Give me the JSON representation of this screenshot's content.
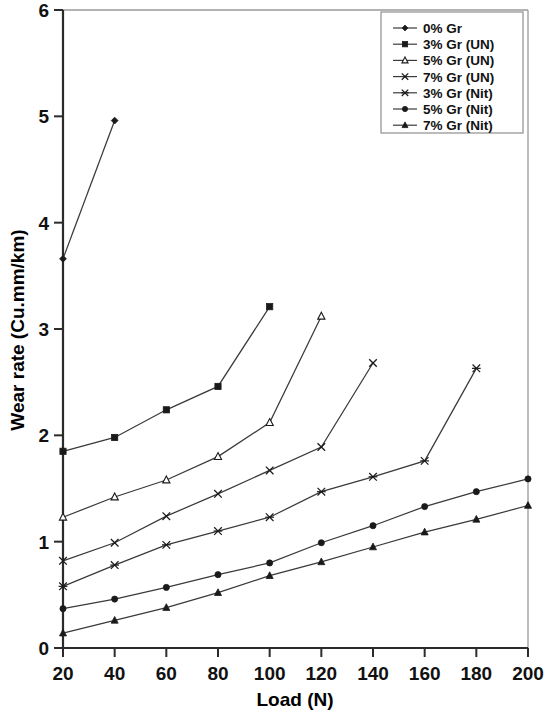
{
  "chart_data": {
    "type": "line",
    "title": "",
    "xlabel": "Load (N)",
    "ylabel": "Wear rate (Cu.mm/km)",
    "xlim": [
      20,
      200
    ],
    "ylim": [
      0,
      6
    ],
    "xticks": [
      20,
      40,
      60,
      80,
      100,
      120,
      140,
      160,
      180,
      200
    ],
    "yticks": [
      0,
      1,
      2,
      3,
      4,
      5,
      6
    ],
    "grid": false,
    "legend_position": "top-right",
    "series": [
      {
        "name": "0% Gr",
        "marker": "diamond",
        "x": [
          20,
          40
        ],
        "values": [
          3.66,
          4.96
        ]
      },
      {
        "name": "3% Gr (UN)",
        "marker": "square-filled",
        "x": [
          20,
          40,
          60,
          80,
          100
        ],
        "values": [
          1.85,
          1.98,
          2.24,
          2.46,
          3.21
        ]
      },
      {
        "name": "5% Gr (UN)",
        "marker": "triangle-open",
        "x": [
          20,
          40,
          60,
          80,
          100,
          120
        ],
        "values": [
          1.23,
          1.42,
          1.58,
          1.8,
          2.12,
          3.12
        ]
      },
      {
        "name": "7% Gr (UN)",
        "marker": "cross",
        "x": [
          20,
          40,
          60,
          80,
          100,
          120,
          140
        ],
        "values": [
          0.82,
          0.99,
          1.24,
          1.45,
          1.67,
          1.89,
          2.68
        ]
      },
      {
        "name": "3% Gr (Nit)",
        "marker": "asterisk",
        "x": [
          20,
          40,
          60,
          80,
          100,
          120,
          140,
          160,
          180
        ],
        "values": [
          0.58,
          0.78,
          0.97,
          1.1,
          1.23,
          1.47,
          1.61,
          1.76,
          2.63
        ]
      },
      {
        "name": "5% Gr (Nit)",
        "marker": "circle-filled",
        "x": [
          20,
          40,
          60,
          80,
          100,
          120,
          140,
          160,
          180,
          200
        ],
        "values": [
          0.37,
          0.46,
          0.57,
          0.69,
          0.8,
          0.99,
          1.15,
          1.33,
          1.47,
          1.59
        ]
      },
      {
        "name": "7% Gr (Nit)",
        "marker": "triangle-filled",
        "x": [
          20,
          40,
          60,
          80,
          100,
          120,
          140,
          160,
          180,
          200
        ],
        "values": [
          0.14,
          0.26,
          0.38,
          0.52,
          0.68,
          0.81,
          0.95,
          1.09,
          1.21,
          1.34
        ]
      }
    ]
  },
  "axes": {
    "x_label": "Load (N)",
    "y_label": "Wear rate (Cu.mm/km)"
  },
  "legend": {
    "items": [
      {
        "label": "0% Gr"
      },
      {
        "label": "3% Gr (UN)"
      },
      {
        "label": "5% Gr (UN)"
      },
      {
        "label": "7% Gr (UN)"
      },
      {
        "label": "3% Gr (Nit)"
      },
      {
        "label": "5% Gr (Nit)"
      },
      {
        "label": "7% Gr (Nit)"
      }
    ]
  },
  "colors": {
    "line": "#3a3a3a",
    "axis": "#2b2b2b",
    "frame": "#9a9a9a",
    "text": "#111111",
    "background": "#ffffff"
  }
}
